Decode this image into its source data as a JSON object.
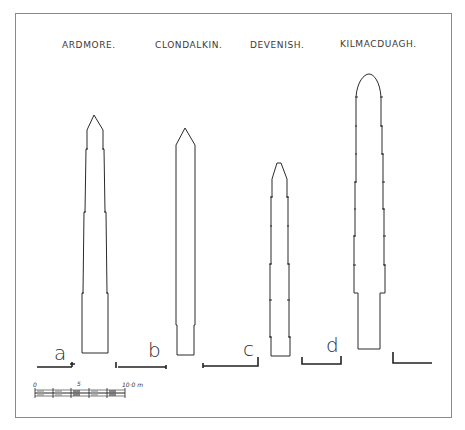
{
  "figure": {
    "titles": [
      {
        "label": "ARDMORE.",
        "x": 62,
        "y": 48
      },
      {
        "label": "CLONDALKIN.",
        "x": 155,
        "y": 48
      },
      {
        "label": "DEVENISH.",
        "x": 250,
        "y": 48
      },
      {
        "label": "KILMACDUAGH.",
        "x": 340,
        "y": 47
      }
    ],
    "tower_letters": [
      "a",
      "b",
      "c",
      "d"
    ],
    "scale_bar": {
      "label_start": "0",
      "label_mid": "5",
      "label_end": "10·0 m"
    },
    "colors": {
      "ink": "#2a2a2a",
      "frame": "#8a8a8a",
      "background": "#ffffff"
    }
  }
}
